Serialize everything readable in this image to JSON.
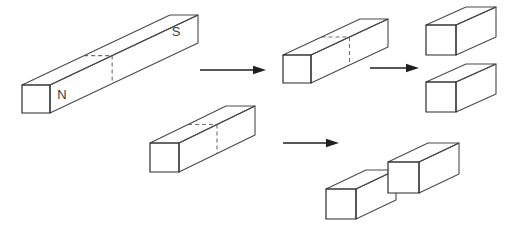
{
  "figure": {
    "background_color": "#ffffff",
    "width": 515,
    "height": 227,
    "stroke_color": "#4a4a4a",
    "dashed_color": "#6f6f6f",
    "arrow_color": "#1f1f1f",
    "label_color": "#3c3c3c"
  },
  "labels": {
    "north_pole": "N",
    "south_pole": "S"
  },
  "objects": [
    {
      "id": "original-bar",
      "name": "original-bar-magnet",
      "description": "long rectangular bar magnet with north and south poles",
      "front_face": {
        "x": 22,
        "y": 85,
        "w": 28,
        "h": 28
      },
      "depth_dx": 148,
      "depth_dy": -70,
      "dash_split_ratio": 0.42,
      "has_dashed_split": true,
      "labels": [
        {
          "text": "N",
          "x": 62,
          "y": 96
        },
        {
          "text": "S",
          "x": 176,
          "y": 33
        }
      ]
    },
    {
      "id": "half-bar-upper",
      "name": "upper-half-bar-magnet",
      "description": "shorter bar magnet produced by the first cut, upper branch",
      "front_face": {
        "x": 283,
        "y": 55,
        "w": 28,
        "h": 28
      },
      "depth_dx": 77,
      "depth_dy": -36,
      "dash_split_ratio": 0.5,
      "has_dashed_split": true,
      "labels": []
    },
    {
      "id": "half-bar-lower",
      "name": "lower-half-bar-magnet",
      "description": "shorter bar magnet produced by the first cut, lower branch",
      "front_face": {
        "x": 150,
        "y": 143,
        "w": 29,
        "h": 29
      },
      "depth_dx": 76,
      "depth_dy": -37,
      "dash_split_ratio": 0.5,
      "has_dashed_split": true,
      "labels": []
    },
    {
      "id": "cube-top-1",
      "name": "small-magnet-cube-top-upper",
      "description": "small cube magnet, upper right top",
      "front_face": {
        "x": 426,
        "y": 25,
        "w": 30,
        "h": 30
      },
      "depth_dx": 40,
      "depth_dy": -18,
      "has_dashed_split": false,
      "labels": []
    },
    {
      "id": "cube-top-2",
      "name": "small-magnet-cube-top-lower",
      "description": "small cube magnet, upper right bottom",
      "front_face": {
        "x": 426,
        "y": 82,
        "w": 30,
        "h": 30
      },
      "depth_dx": 40,
      "depth_dy": -18,
      "has_dashed_split": false,
      "labels": []
    },
    {
      "id": "cube-bottom-1",
      "name": "small-magnet-cube-bottom-left",
      "description": "small cube magnet, lower right left",
      "front_face": {
        "x": 326,
        "y": 189,
        "w": 30,
        "h": 30
      },
      "depth_dx": 40,
      "depth_dy": -19,
      "has_dashed_split": false,
      "labels": []
    },
    {
      "id": "cube-bottom-2",
      "name": "small-magnet-cube-bottom-right",
      "description": "small cube magnet, lower right right",
      "front_face": {
        "x": 388,
        "y": 162,
        "w": 31,
        "h": 31
      },
      "depth_dx": 40,
      "depth_dy": -19,
      "has_dashed_split": false,
      "labels": []
    }
  ],
  "arrows": [
    {
      "id": "arrow-1",
      "name": "arrow-first-division",
      "x1": 200,
      "y1": 70,
      "x2": 266,
      "y2": 70
    },
    {
      "id": "arrow-2",
      "name": "arrow-second-division-upper",
      "x1": 370,
      "y1": 68,
      "x2": 419,
      "y2": 68
    },
    {
      "id": "arrow-3",
      "name": "arrow-second-division-lower",
      "x1": 283,
      "y1": 143,
      "x2": 339,
      "y2": 143
    }
  ]
}
